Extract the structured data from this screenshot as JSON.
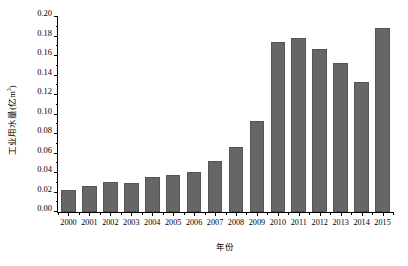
{
  "chart_data": {
    "type": "bar",
    "title": "",
    "xlabel": "年份",
    "ylabel": "工业用水量(亿m³)",
    "ylabel_main": "工业用水量(亿m",
    "ylabel_sup": "3",
    "ylabel_tail": ")",
    "categories": [
      "2000",
      "2001",
      "2002",
      "2003",
      "2004",
      "2005",
      "2006",
      "2007",
      "2008",
      "2009",
      "2010",
      "2011",
      "2012",
      "2013",
      "2014",
      "2015"
    ],
    "values": [
      0.023,
      0.027,
      0.031,
      0.03,
      0.036,
      0.038,
      0.041,
      0.052,
      0.067,
      0.093,
      0.174,
      0.178,
      0.167,
      0.153,
      0.133,
      0.189
    ],
    "ylim": [
      0.0,
      0.2
    ],
    "ytick_labels": [
      "0.00",
      "0.02",
      "0.04",
      "0.06",
      "0.08",
      "0.10",
      "0.12",
      "0.14",
      "0.16",
      "0.18",
      "0.20"
    ],
    "ytick_values": [
      0.0,
      0.02,
      0.04,
      0.06,
      0.08,
      0.1,
      0.12,
      0.14,
      0.16,
      0.18,
      0.2
    ],
    "yminor_values": [
      0.01,
      0.03,
      0.05,
      0.07,
      0.09,
      0.11,
      0.13,
      0.15,
      0.17,
      0.19
    ],
    "grid": false,
    "legend": null,
    "bar_color": "#666666",
    "bar_edge_color": "#555555",
    "axis_color": "#000000",
    "background": "#ffffff"
  }
}
